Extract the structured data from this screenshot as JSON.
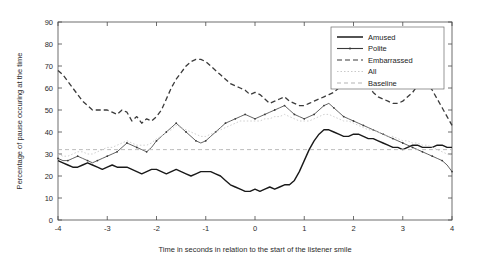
{
  "chart_data": {
    "type": "line",
    "title": "",
    "xlabel": "Time in seconds in relation to the start of the listener smile",
    "ylabel": "Percentage of pause occuring at the time",
    "xlim": [
      -4,
      4
    ],
    "ylim": [
      0,
      90
    ],
    "xticks": [
      -4,
      -3,
      -2,
      -1,
      0,
      1,
      2,
      3,
      4
    ],
    "xticklabels": [
      "-4",
      "-3",
      "-2",
      "-1",
      "0",
      "1",
      "2",
      "3",
      "4"
    ],
    "yticks": [
      0,
      10,
      20,
      30,
      40,
      50,
      60,
      70,
      80,
      90
    ],
    "yticklabels": [
      "0",
      "10",
      "20",
      "30",
      "40",
      "50",
      "60",
      "70",
      "80",
      "90"
    ],
    "grid": false,
    "legend_position": "upper right",
    "legend_entries": [
      "Amused",
      "Polite",
      "Embarrassed",
      "All",
      "Baseline"
    ],
    "x": [
      -4,
      -3.9,
      -3.8,
      -3.7,
      -3.6,
      -3.5,
      -3.4,
      -3.3,
      -3.2,
      -3.1,
      -3,
      -2.9,
      -2.8,
      -2.7,
      -2.6,
      -2.5,
      -2.4,
      -2.3,
      -2.2,
      -2.1,
      -2,
      -1.9,
      -1.8,
      -1.7,
      -1.6,
      -1.5,
      -1.4,
      -1.3,
      -1.2,
      -1.1,
      -1,
      -0.9,
      -0.8,
      -0.7,
      -0.6,
      -0.5,
      -0.4,
      -0.3,
      -0.2,
      -0.1,
      0,
      0.1,
      0.2,
      0.3,
      0.4,
      0.5,
      0.6,
      0.7,
      0.8,
      0.9,
      1,
      1.1,
      1.2,
      1.3,
      1.4,
      1.5,
      1.6,
      1.7,
      1.8,
      1.9,
      2,
      2.1,
      2.2,
      2.3,
      2.4,
      2.5,
      2.6,
      2.7,
      2.8,
      2.9,
      3,
      3.1,
      3.2,
      3.3,
      3.4,
      3.5,
      3.6,
      3.7,
      3.8,
      3.9,
      4
    ],
    "series": [
      {
        "name": "Amused",
        "style": "solid",
        "color": "#1a1a1a",
        "width": 1.4,
        "values": [
          27,
          26,
          25,
          24,
          24,
          25,
          26,
          25,
          24,
          23,
          24,
          25,
          24,
          24,
          24,
          23,
          22,
          21,
          22,
          23,
          23,
          22,
          21,
          22,
          23,
          22,
          21,
          20,
          21,
          22,
          22,
          22,
          21,
          20,
          18,
          16,
          15,
          14,
          13,
          13,
          14,
          13,
          14,
          15,
          14,
          15,
          16,
          16,
          18,
          22,
          27,
          32,
          36,
          39,
          41,
          41,
          40,
          39,
          38,
          38,
          39,
          39,
          38,
          37,
          37,
          36,
          35,
          34,
          33,
          33,
          32,
          33,
          34,
          34,
          33,
          33,
          33,
          34,
          34,
          33,
          33
        ]
      },
      {
        "name": "Polite",
        "style": "solid-marker",
        "color": "#3a3a3a",
        "width": 0.8,
        "values": [
          28,
          27,
          27,
          28,
          29,
          28,
          27,
          26,
          27,
          28,
          29,
          30,
          31,
          33,
          35,
          34,
          33,
          32,
          31,
          33,
          36,
          38,
          40,
          42,
          44,
          42,
          40,
          38,
          36,
          35,
          36,
          38,
          40,
          42,
          44,
          45,
          46,
          47,
          48,
          47,
          46,
          47,
          48,
          49,
          50,
          51,
          52,
          50,
          48,
          47,
          46,
          47,
          48,
          50,
          52,
          53,
          51,
          49,
          47,
          46,
          45,
          44,
          43,
          42,
          41,
          40,
          39,
          38,
          37,
          36,
          35,
          34,
          33,
          32,
          31,
          30,
          29,
          28,
          27,
          25,
          22
        ]
      },
      {
        "name": "Embarrassed",
        "style": "dashed",
        "color": "#3a3a3a",
        "width": 1.3,
        "values": [
          68,
          66,
          63,
          60,
          57,
          54,
          52,
          50,
          50,
          50,
          50,
          49,
          48,
          50,
          49,
          45,
          47,
          44,
          46,
          45,
          47,
          50,
          55,
          60,
          64,
          67,
          70,
          72,
          73,
          73,
          72,
          70,
          68,
          66,
          64,
          62,
          61,
          60,
          59,
          57,
          58,
          57,
          55,
          53,
          54,
          55,
          56,
          54,
          53,
          52,
          52,
          53,
          54,
          55,
          56,
          57,
          58,
          60,
          63,
          66,
          68,
          67,
          64,
          61,
          58,
          56,
          55,
          54,
          53,
          53,
          54,
          56,
          58,
          61,
          63,
          62,
          59,
          55,
          51,
          47,
          43
        ]
      },
      {
        "name": "All",
        "style": "dotted-light",
        "color": "#c9c9c9",
        "width": 0.9,
        "values": [
          30,
          29,
          29,
          30,
          31,
          31,
          30,
          30,
          31,
          32,
          33,
          33,
          34,
          35,
          36,
          35,
          34,
          34,
          34,
          35,
          37,
          38,
          40,
          41,
          43,
          42,
          41,
          40,
          39,
          38,
          38,
          39,
          40,
          41,
          42,
          43,
          44,
          45,
          45,
          45,
          45,
          45,
          46,
          46,
          47,
          47,
          48,
          47,
          46,
          45,
          45,
          45,
          46,
          47,
          48,
          48,
          47,
          46,
          45,
          45,
          44,
          43,
          42,
          41,
          41,
          40,
          39,
          38,
          38,
          37,
          36,
          36,
          35,
          35,
          34,
          34,
          33,
          32,
          31,
          30,
          29
        ]
      },
      {
        "name": "Baseline",
        "style": "dashed-light",
        "color": "#b4b4b4",
        "width": 0.9,
        "constant": 32,
        "values": [
          32,
          32,
          32,
          32,
          32,
          32,
          32,
          32,
          32,
          32,
          32,
          32,
          32,
          32,
          32,
          32,
          32,
          32,
          32,
          32,
          32,
          32,
          32,
          32,
          32,
          32,
          32,
          32,
          32,
          32,
          32,
          32,
          32,
          32,
          32,
          32,
          32,
          32,
          32,
          32,
          32,
          32,
          32,
          32,
          32,
          32,
          32,
          32,
          32,
          32,
          32,
          32,
          32,
          32,
          32,
          32,
          32,
          32,
          32,
          32,
          32,
          32,
          32,
          32,
          32,
          32,
          32,
          32,
          32,
          32,
          32,
          32,
          32,
          32,
          32,
          32,
          32,
          32,
          32,
          32,
          32
        ]
      }
    ]
  },
  "legend": {
    "items": [
      {
        "label": "Amused",
        "style": "solid",
        "color": "#1a1a1a"
      },
      {
        "label": "Polite",
        "style": "solid-marker",
        "color": "#3a3a3a"
      },
      {
        "label": "Embarrassed",
        "style": "dashed",
        "color": "#3a3a3a"
      },
      {
        "label": "All",
        "style": "dotted-light",
        "color": "#c9c9c9"
      },
      {
        "label": "Baseline",
        "style": "dashed-light",
        "color": "#b4b4b4"
      }
    ]
  },
  "colors": {
    "background": "#ffffff",
    "axis": "#4a4a4a",
    "text": "#2b2b2b"
  }
}
